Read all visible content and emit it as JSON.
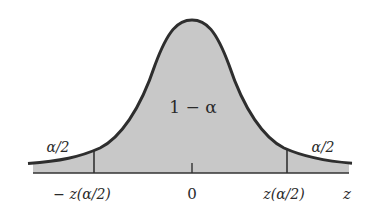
{
  "figure": {
    "center_label": "1 − α",
    "left_tail_label": "α/2",
    "right_tail_label": "α/2",
    "axis_ticks": {
      "left": "− z(α/2)",
      "center": "0",
      "right": "z(α/2)"
    },
    "axis_name": "z",
    "colors": {
      "curve": "#2e2e2e",
      "fill": "#c8c8c8",
      "background": "#ffffff",
      "text": "#2a2a2a"
    }
  }
}
